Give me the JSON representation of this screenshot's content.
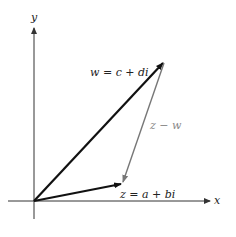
{
  "diagram": {
    "axes": {
      "x_label": "x",
      "y_label": "y"
    },
    "vectors": {
      "w": {
        "label": "w = c + di",
        "color": "#111111"
      },
      "z": {
        "label": "z = a + bi",
        "color": "#111111"
      },
      "diff": {
        "label": "z − w",
        "color": "#888888"
      }
    }
  }
}
